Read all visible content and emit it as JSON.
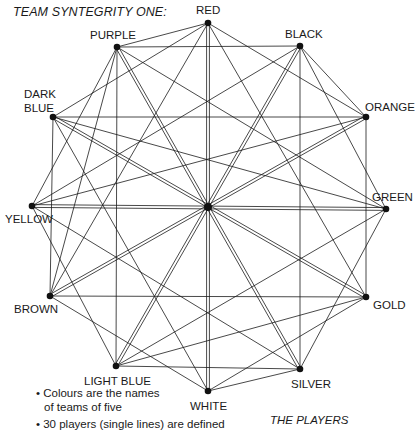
{
  "title": "TEAM SYNTEGRITY ONE:",
  "center": {
    "x": 208,
    "y": 207
  },
  "vertices": [
    {
      "id": "red",
      "label": "RED",
      "x": 208,
      "y": 23,
      "lx": 196,
      "ly": 3
    },
    {
      "id": "black",
      "label": "BLACK",
      "x": 300,
      "y": 46,
      "lx": 285,
      "ly": 27
    },
    {
      "id": "orange",
      "label": "ORANGE",
      "x": 366,
      "y": 117,
      "lx": 365,
      "ly": 100
    },
    {
      "id": "green",
      "label": "GREEN",
      "x": 386,
      "y": 209,
      "lx": 372,
      "ly": 190
    },
    {
      "id": "gold",
      "label": "GOLD",
      "x": 366,
      "y": 297,
      "lx": 373,
      "ly": 298
    },
    {
      "id": "silver",
      "label": "SILVER",
      "x": 300,
      "y": 369,
      "lx": 291,
      "ly": 377
    },
    {
      "id": "white",
      "label": "WHITE",
      "x": 208,
      "y": 391,
      "lx": 190,
      "ly": 399
    },
    {
      "id": "light-blue",
      "label": "LIGHT BLUE",
      "x": 116,
      "y": 366,
      "lx": 84,
      "ly": 374
    },
    {
      "id": "brown",
      "label": "BROWN",
      "x": 50,
      "y": 296,
      "lx": 14,
      "ly": 302
    },
    {
      "id": "yellow",
      "label": "YELLOW",
      "x": 32,
      "y": 206,
      "lx": 5,
      "ly": 212
    },
    {
      "id": "dark-blue",
      "label": "DARK BLUE",
      "x": 53,
      "y": 117,
      "lx": 24,
      "ly": 87,
      "multiline": [
        "DARK",
        "BLUE"
      ]
    },
    {
      "id": "purple",
      "label": "PURPLE",
      "x": 117,
      "y": 47,
      "lx": 90,
      "ly": 28
    }
  ],
  "double_lines": [
    [
      0,
      6
    ],
    [
      1,
      7
    ],
    [
      2,
      8
    ],
    [
      3,
      9
    ],
    [
      4,
      10
    ],
    [
      5,
      11
    ]
  ],
  "edges": [
    [
      0,
      11
    ],
    [
      0,
      2
    ],
    [
      0,
      10
    ],
    [
      0,
      4
    ],
    [
      0,
      8
    ],
    [
      1,
      3
    ],
    [
      1,
      9
    ],
    [
      1,
      11
    ],
    [
      1,
      5
    ],
    [
      1,
      2
    ],
    [
      2,
      4
    ],
    [
      2,
      10
    ],
    [
      2,
      9
    ],
    [
      3,
      5
    ],
    [
      3,
      11
    ],
    [
      3,
      7
    ],
    [
      3,
      10
    ],
    [
      4,
      6
    ],
    [
      4,
      8
    ],
    [
      4,
      7
    ],
    [
      5,
      7
    ],
    [
      5,
      6
    ],
    [
      5,
      9
    ],
    [
      6,
      8
    ],
    [
      6,
      10
    ],
    [
      7,
      9
    ],
    [
      7,
      11
    ],
    [
      8,
      10
    ],
    [
      8,
      11
    ],
    [
      9,
      11
    ]
  ],
  "notes": [
    "• Colours are the names",
    "  of teams of five",
    "• 30 players (single lines) are defined"
  ],
  "footer_caption": "THE PLAYERS"
}
